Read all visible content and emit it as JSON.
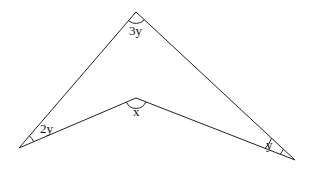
{
  "diagram": {
    "type": "concave quadrilateral (arrowhead)",
    "vertices": {
      "top": {
        "x": 136,
        "y": 12,
        "angle_label": "3y"
      },
      "left": {
        "x": 19,
        "y": 148,
        "angle_label": "2y"
      },
      "middle": {
        "x": 136,
        "y": 98,
        "angle_label": "x"
      },
      "right": {
        "x": 295,
        "y": 160,
        "angle_label": "y"
      }
    },
    "labels": {
      "top": "3y",
      "left": "2y",
      "middle": "x",
      "right": "y"
    },
    "line_color": "#222222"
  }
}
